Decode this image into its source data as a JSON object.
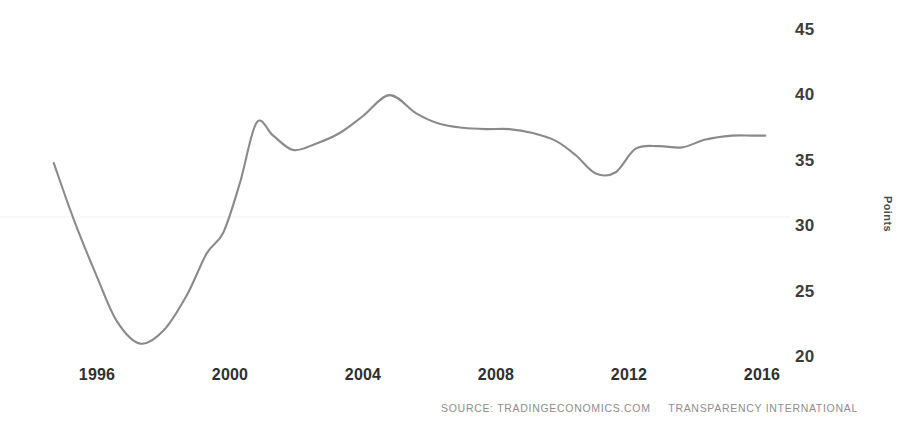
{
  "chart_data": {
    "type": "line",
    "title": "",
    "subtitle": "",
    "xlabel": "",
    "ylabel": "Points",
    "xlim": [
      1994.6,
      2016.2
    ],
    "ylim": [
      20,
      45
    ],
    "grid": false,
    "legend": null,
    "line_color": "#8a8a8a",
    "x_ticks": [
      "1996",
      "2000",
      "2004",
      "2008",
      "2012",
      "2016"
    ],
    "x_tick_values": [
      1996,
      2000,
      2004,
      2008,
      2012,
      2016
    ],
    "y_ticks": [
      "20",
      "25",
      "30",
      "35",
      "40",
      "45"
    ],
    "y_tick_values": [
      20,
      25,
      30,
      35,
      40,
      45
    ],
    "x": [
      1994.7,
      1995.3,
      1996.0,
      1996.6,
      1997.3,
      1998.0,
      1998.7,
      1999.3,
      1999.8,
      2000.3,
      2000.8,
      2001.3,
      2001.9,
      2002.6,
      2003.3,
      2004.0,
      2004.8,
      2005.6,
      2006.3,
      2007.0,
      2007.7,
      2008.4,
      2009.1,
      2009.8,
      2010.4,
      2011.0,
      2011.6,
      2012.2,
      2012.9,
      2013.6,
      2014.3,
      2015.1,
      2015.7,
      2016.1
    ],
    "values": [
      34.9,
      30.6,
      26.2,
      22.8,
      21.1,
      22.1,
      24.8,
      28.0,
      29.6,
      33.4,
      38.0,
      37.0,
      35.9,
      36.4,
      37.2,
      38.5,
      40.1,
      38.7,
      37.9,
      37.6,
      37.5,
      37.5,
      37.2,
      36.6,
      35.5,
      34.1,
      34.2,
      36.0,
      36.2,
      36.1,
      36.7,
      37.0,
      37.0,
      37.0
    ],
    "series": [
      {
        "name": "Corruption Perceptions Index",
        "values": [
          34.9,
          30.6,
          26.2,
          22.8,
          21.1,
          22.1,
          24.8,
          28.0,
          29.6,
          33.4,
          38.0,
          37.0,
          35.9,
          36.4,
          37.2,
          38.5,
          40.1,
          38.7,
          37.9,
          37.6,
          37.5,
          37.5,
          37.2,
          36.6,
          35.5,
          34.1,
          34.2,
          36.0,
          36.2,
          36.1,
          36.7,
          37.0,
          37.0,
          37.0
        ]
      }
    ],
    "annotations": []
  },
  "source": {
    "label": "SOURCE: TRADINGECONOMICS.COM",
    "provider": "TRANSPARENCY INTERNATIONAL"
  }
}
